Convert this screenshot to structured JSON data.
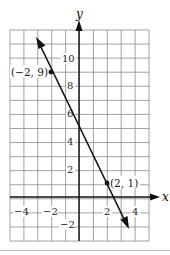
{
  "axes": {
    "x_label": "x",
    "y_label": "y"
  },
  "x_ticks": [
    "-4",
    "-2",
    "2",
    "4"
  ],
  "y_ticks": [
    "10",
    "8",
    "6",
    "4",
    "2",
    "-2"
  ],
  "points": [
    {
      "label": "(-2, 9)",
      "x": -2,
      "y": 9
    },
    {
      "label": "(2, 1)",
      "x": 2,
      "y": 1
    }
  ],
  "grid": {
    "x_min": -5,
    "x_max": 5,
    "y_min": -3,
    "y_max": 12
  },
  "line": {
    "slope": -2,
    "intercept": 5
  },
  "colors": {
    "line": "#1a1a1a",
    "grid": "#888888"
  }
}
